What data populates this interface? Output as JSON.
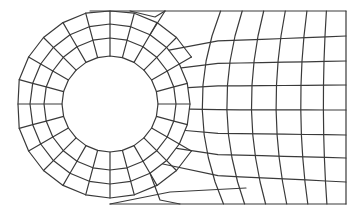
{
  "diagram": {
    "type": "finite-element-mesh",
    "colors": {
      "background": "#ffffff",
      "line": "#3a3a3a"
    },
    "hole": {
      "cx": 110,
      "cy": 104,
      "r_inner": 48,
      "r_ring1": 66,
      "r_ring2": 84
    },
    "radial_divisions": 24,
    "outer_boundary": {
      "left_x": 18,
      "top_y": 11,
      "bottom_y": 204,
      "right_x": 346
    },
    "grid": {
      "columns_x": [
        218,
        240,
        262,
        284,
        306,
        326,
        346
      ],
      "rows_y": [
        11,
        36,
        61,
        85,
        110,
        135,
        158,
        182,
        204
      ]
    }
  }
}
